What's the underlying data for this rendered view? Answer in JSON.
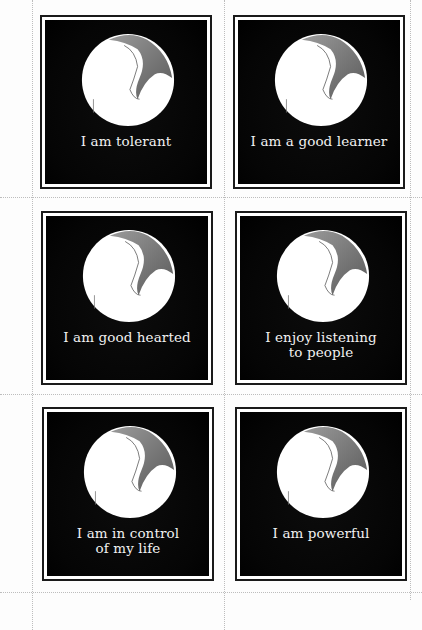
{
  "worksheet": {
    "layout": {
      "columns": 2,
      "rows": 3
    },
    "cards": [
      {
        "lines": [
          "I am tolerant"
        ]
      },
      {
        "lines": [
          "I am a good learner"
        ]
      },
      {
        "lines": [
          "I am good hearted"
        ]
      },
      {
        "lines": [
          "I enjoy listening",
          "to people"
        ]
      },
      {
        "lines": [
          "I am in control",
          "of my life"
        ]
      },
      {
        "lines": [
          "I am powerful"
        ]
      }
    ],
    "illustration": "moon-orb-icon",
    "colors": {
      "card_background": "#000000",
      "card_frame": "#1a1a1a",
      "orb_light": "#ffffff",
      "orb_shadow": "#7a7a7a",
      "caption_text": "#f2f2f2",
      "cut_line": "#bdbdbd"
    }
  }
}
